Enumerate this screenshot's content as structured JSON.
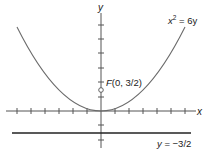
{
  "diagram": {
    "type": "parabola-focus-directrix",
    "equation": {
      "lhs_var": "x",
      "exponent": "2",
      "rhs": " = 6y"
    },
    "axes": {
      "x_label": "x",
      "y_label": "y",
      "unit_px": 14,
      "origin_px": [
        101,
        111
      ]
    },
    "focus": {
      "label_prefix": "F",
      "label_coords": "(0, 3/2)",
      "x": 0,
      "y": 1.5
    },
    "directrix": {
      "label_var": "y",
      "label_value": " = −3/2",
      "y": -1.5
    },
    "colors": {
      "curve": "#6b6b6b",
      "axis": "#555555",
      "directrix": "#222222",
      "text": "#1a1a1a"
    }
  }
}
